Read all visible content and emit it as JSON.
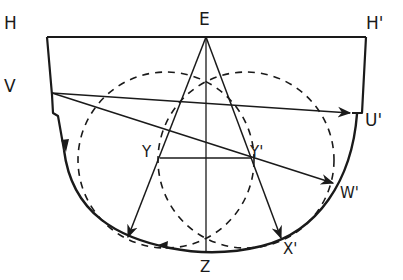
{
  "diagram": {
    "labels": {
      "H": "H",
      "E": "E",
      "H_prime": "H'",
      "V": "V",
      "U_prime": "U'",
      "Y": "Y",
      "Y_prime": "Y'",
      "W_prime": "W'",
      "X_prime": "X'",
      "Z": "Z"
    },
    "colors": {
      "ink": "#1a1a1a",
      "background": "#ffffff"
    }
  }
}
